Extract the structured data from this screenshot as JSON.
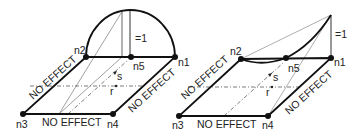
{
  "left_diagram": {
    "nodes": {
      "n1": "n1",
      "n2": "n2",
      "n3": "n3",
      "n4": "n4",
      "n5": "n5"
    },
    "edge_labels": {
      "left": "NO EFFECT",
      "bottom": "NO EFFECT",
      "right": "NO EFFECT"
    },
    "height_label": "=1",
    "axis_s": "s",
    "axis_r": "r"
  },
  "right_diagram": {
    "nodes": {
      "n1": "n1",
      "n2": "n2",
      "n3": "n3",
      "n4": "n4",
      "n5": "n5"
    },
    "edge_labels": {
      "left": "NO EFFECT",
      "bottom": "NO EFFECT",
      "right": "NO EFFECT"
    },
    "height_label": "=1",
    "axis_s": "s",
    "axis_r": "r"
  },
  "colors": {
    "line": "#111111",
    "thin": "#777777",
    "text": "#222222"
  }
}
